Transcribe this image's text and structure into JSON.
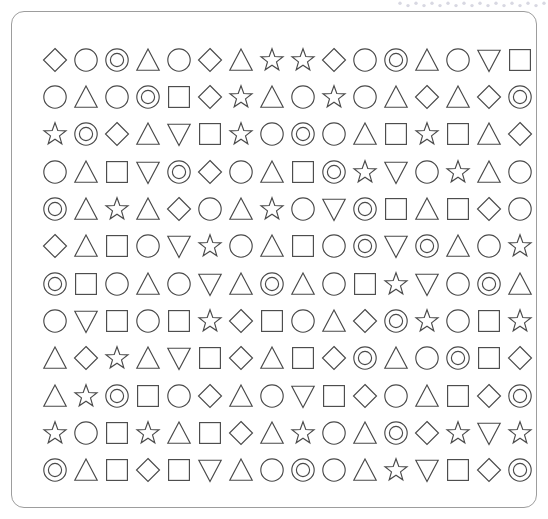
{
  "canvas": {
    "width": 548,
    "height": 519,
    "background_color": "#ffffff"
  },
  "top_strip": {
    "name": "dotted-zigzag-strip",
    "description": "faint light-gray dotted zigzag clipped at the top edge",
    "color": "#d8d8e2",
    "dot_count": 19
  },
  "card": {
    "name": "rounded-panel",
    "border_color": "#9d9d9d",
    "border_radius": 13,
    "background_color": "#ffffff"
  },
  "grid": {
    "rows": 12,
    "columns": 16,
    "total_shapes": 192,
    "stroke_color": "#4a4a4a",
    "fill": "none",
    "shape_legend": {
      "diamond": "diamond",
      "circle": "circle",
      "double-circle": "concentric double circle",
      "triangle": "upward triangle",
      "down-triangle": "downward triangle",
      "square": "square",
      "star": "five-pointed star outline"
    },
    "shape_counts": {
      "circle": 40,
      "triangle": 40,
      "square": 27,
      "diamond": 26,
      "star": 25,
      "double-circle": 23,
      "down-triangle": 11
    },
    "cells": [
      [
        "diamond",
        "circle",
        "double-circle",
        "triangle",
        "circle",
        "diamond",
        "triangle",
        "star",
        "star",
        "diamond",
        "circle",
        "double-circle",
        "triangle",
        "circle",
        "down-triangle",
        "square"
      ],
      [
        "circle",
        "triangle",
        "circle",
        "double-circle",
        "square",
        "diamond",
        "star",
        "triangle",
        "circle",
        "star",
        "circle",
        "triangle",
        "diamond",
        "triangle",
        "diamond",
        "double-circle"
      ],
      [
        "star",
        "double-circle",
        "diamond",
        "triangle",
        "down-triangle",
        "square",
        "star",
        "circle",
        "double-circle",
        "circle",
        "triangle",
        "square",
        "star",
        "square",
        "triangle",
        "diamond"
      ],
      [
        "circle",
        "triangle",
        "square",
        "down-triangle",
        "double-circle",
        "diamond",
        "circle",
        "triangle",
        "square",
        "double-circle",
        "star",
        "down-triangle",
        "circle",
        "star",
        "triangle",
        "circle"
      ],
      [
        "double-circle",
        "triangle",
        "star",
        "triangle",
        "diamond",
        "circle",
        "triangle",
        "star",
        "circle",
        "down-triangle",
        "double-circle",
        "square",
        "triangle",
        "square",
        "diamond",
        "circle"
      ],
      [
        "diamond",
        "triangle",
        "square",
        "circle",
        "down-triangle",
        "star",
        "circle",
        "triangle",
        "square",
        "circle",
        "double-circle",
        "down-triangle",
        "double-circle",
        "triangle",
        "circle",
        "star"
      ],
      [
        "double-circle",
        "square",
        "circle",
        "triangle",
        "circle",
        "down-triangle",
        "triangle",
        "double-circle",
        "triangle",
        "circle",
        "square",
        "star",
        "down-triangle",
        "circle",
        "double-circle",
        "triangle"
      ],
      [
        "circle",
        "down-triangle",
        "square",
        "circle",
        "square",
        "star",
        "diamond",
        "square",
        "circle",
        "triangle",
        "diamond",
        "double-circle",
        "star",
        "circle",
        "square",
        "star"
      ],
      [
        "triangle",
        "diamond",
        "star",
        "triangle",
        "down-triangle",
        "square",
        "diamond",
        "triangle",
        "square",
        "diamond",
        "double-circle",
        "triangle",
        "circle",
        "double-circle",
        "square",
        "diamond"
      ],
      [
        "triangle",
        "star",
        "double-circle",
        "square",
        "circle",
        "diamond",
        "triangle",
        "circle",
        "down-triangle",
        "square",
        "diamond",
        "circle",
        "triangle",
        "square",
        "diamond",
        "double-circle"
      ],
      [
        "star",
        "circle",
        "square",
        "star",
        "triangle",
        "square",
        "diamond",
        "triangle",
        "star",
        "circle",
        "triangle",
        "double-circle",
        "diamond",
        "star",
        "down-triangle",
        "star"
      ],
      [
        "double-circle",
        "triangle",
        "square",
        "diamond",
        "square",
        "down-triangle",
        "triangle",
        "circle",
        "double-circle",
        "circle",
        "triangle",
        "star",
        "down-triangle",
        "square",
        "diamond",
        "double-circle"
      ]
    ]
  }
}
